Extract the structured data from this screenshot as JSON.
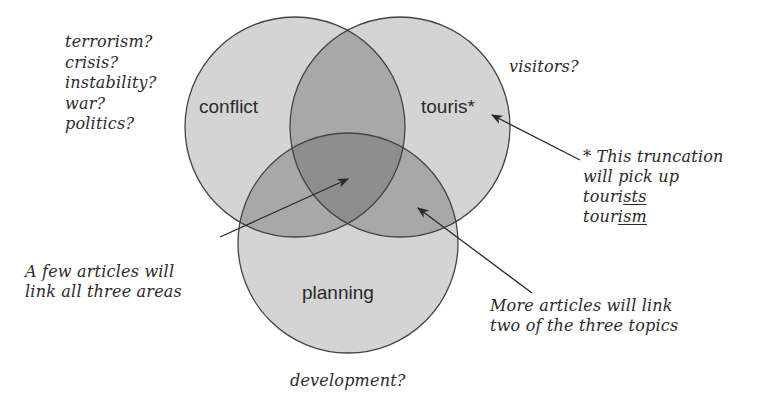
{
  "diagram": {
    "type": "venn",
    "circles": [
      {
        "id": "conflict",
        "label": "conflict",
        "cx": 295,
        "cy": 127,
        "r": 110
      },
      {
        "id": "tourism",
        "label": "touris*",
        "cx": 400,
        "cy": 127,
        "r": 110
      },
      {
        "id": "planning",
        "label": "planning",
        "cx": 348,
        "cy": 243,
        "r": 110
      }
    ],
    "colors": {
      "single": "#d4d4d4",
      "double": "#a8a8a8",
      "triple": "#8e8e8e",
      "stroke": "#444444",
      "text": "#2a2a2a"
    }
  },
  "notes": {
    "conflict_synonyms": [
      "terrorism?",
      "crisis?",
      "instability?",
      "war?",
      "politics?"
    ],
    "tourism_synonym": "visitors?",
    "planning_synonym": "development?",
    "truncation": {
      "line1": "* This truncation",
      "line2": "will pick up",
      "word1_stem": "touri",
      "word1_suffix": "sts",
      "word2_stem": "tour",
      "word2_suffix": "ism"
    },
    "all_three": [
      "A few articles will",
      "link all three areas"
    ],
    "two_of_three": [
      "More articles will link",
      "two of the three topics"
    ]
  }
}
